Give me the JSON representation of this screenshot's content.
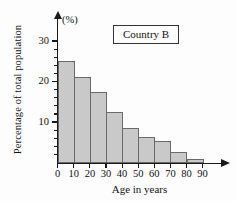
{
  "chart_data": {
    "type": "bar",
    "title": "Country B",
    "unit_label": "(%)",
    "xlabel": "Age in years",
    "ylabel": "Percentage of total population",
    "categories": [
      "0-10",
      "10-20",
      "20-30",
      "30-40",
      "40-50",
      "50-60",
      "60-70",
      "70-80",
      "80-90"
    ],
    "bin_edges": [
      0,
      10,
      20,
      30,
      40,
      50,
      60,
      70,
      80,
      90
    ],
    "values": [
      25.2,
      21.2,
      17.4,
      12.6,
      8.6,
      6.3,
      5.4,
      2.6,
      0.8
    ],
    "xtick_labels": [
      "0",
      "10",
      "20",
      "30",
      "40",
      "50",
      "60",
      "70",
      "80",
      "90"
    ],
    "ytick_labels": [
      "10",
      "20",
      "30"
    ],
    "ytick_values": [
      10,
      20,
      30
    ],
    "yminor_step": 2,
    "ylim": [
      0,
      32
    ],
    "xlim": [
      0,
      90
    ],
    "grid": false,
    "legend": "none",
    "bar_fill_color": "#c9c9c9",
    "bar_edge_color": "#6a6a6a",
    "axis_color": "#1a1a1a"
  }
}
